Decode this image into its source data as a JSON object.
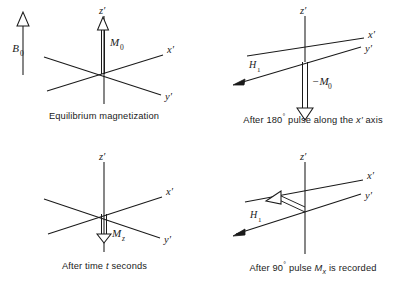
{
  "figure": {
    "stroke_color": "#1a1a1a",
    "background_color": "#ffffff"
  },
  "axis_labels": {
    "z": "z′",
    "x": "x′",
    "y": "y′"
  },
  "panels": [
    {
      "id": "equilibrium",
      "caption": "Equilibrium magnetization",
      "field_label": "B",
      "field_sub": "0",
      "vector_label": "M",
      "vector_sub": "0",
      "vector_direction": "up-along-z",
      "has_b0_arrow": true,
      "has_h1_arrow": false
    },
    {
      "id": "after-180",
      "caption_parts": {
        "pre": "After 180",
        "degree": "°",
        "mid": " pulse along the ",
        "axis": "x′",
        "post": " axis"
      },
      "caption": "After 180° pulse along the x′ axis",
      "vector_label": "−M",
      "vector_sub": "0",
      "vector_direction": "down-along-z",
      "h1_label": "H",
      "h1_sub": "1",
      "has_b0_arrow": false,
      "has_h1_arrow": true
    },
    {
      "id": "after-time-t",
      "caption_parts": {
        "pre": "After time ",
        "var": "t",
        "post": " seconds"
      },
      "caption": "After time t seconds",
      "vector_label": "−M",
      "vector_sub": "z",
      "vector_direction": "down-along-z-short",
      "has_b0_arrow": false,
      "has_h1_arrow": false
    },
    {
      "id": "after-90",
      "caption_parts": {
        "pre": "After 90",
        "degree": "°",
        "mid": " pulse ",
        "var": "M",
        "var_sub": "x",
        "post": " is recorded"
      },
      "caption": "After 90° pulse Mₓ is recorded",
      "vector_direction": "transverse-along-minus-x",
      "h1_label": "H",
      "h1_sub": "1",
      "has_b0_arrow": false,
      "has_h1_arrow": true
    }
  ]
}
